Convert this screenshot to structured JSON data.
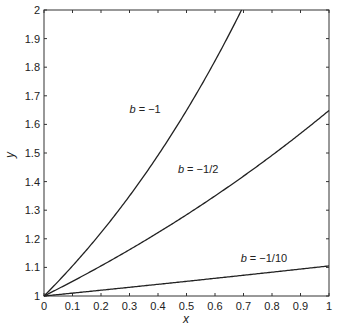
{
  "chart_data": {
    "type": "line",
    "title": "",
    "xlabel": "x",
    "ylabel": "y",
    "xlim": [
      0,
      1
    ],
    "ylim": [
      1,
      2
    ],
    "grid": false,
    "legend": "none (inline annotations)",
    "x_ticks": [
      "0",
      "0.1",
      "0.2",
      "0.3",
      "0.4",
      "0.5",
      "0.6",
      "0.7",
      "0.8",
      "0.9",
      "1"
    ],
    "y_ticks": [
      "1",
      "1.1",
      "1.2",
      "1.3",
      "1.4",
      "1.5",
      "1.6",
      "1.7",
      "1.8",
      "1.9",
      "2"
    ],
    "x": [
      0,
      0.1,
      0.2,
      0.3,
      0.4,
      0.5,
      0.6,
      0.7,
      0.8,
      0.9,
      1.0
    ],
    "series": [
      {
        "name": "b = −1",
        "b": -1,
        "values": [
          1.0,
          1.105,
          1.221,
          1.35,
          1.492,
          1.649,
          1.822,
          2.0,
          null,
          null,
          null
        ],
        "note": "exceeds y=2 near x≈0.69"
      },
      {
        "name": "b = −1/2",
        "b": -0.5,
        "values": [
          1.0,
          1.051,
          1.105,
          1.162,
          1.221,
          1.284,
          1.35,
          1.419,
          1.492,
          1.568,
          1.649
        ]
      },
      {
        "name": "b = −1/10",
        "b": -0.1,
        "values": [
          1.0,
          1.01,
          1.02,
          1.03,
          1.041,
          1.051,
          1.062,
          1.073,
          1.083,
          1.094,
          1.105
        ]
      }
    ],
    "annotations": [
      {
        "text_var": "b",
        "text_rest": " = −1",
        "x": 0.3,
        "y": 1.64
      },
      {
        "text_var": "b",
        "text_rest": " = −1/2",
        "x": 0.47,
        "y": 1.43
      },
      {
        "text_var": "b",
        "text_rest": " = −1/10",
        "x": 0.69,
        "y": 1.12
      }
    ]
  },
  "colors": {
    "line": "#222222",
    "axis": "#333333",
    "background": "#ffffff"
  }
}
